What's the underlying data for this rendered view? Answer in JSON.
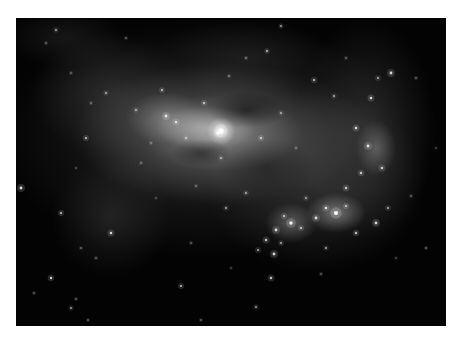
{
  "image": {
    "subject": "irregular dwarf galaxy",
    "palette": {
      "background": "#ffffff",
      "sky": "#030303",
      "core": "#ffffff",
      "glow": "#9a9a9a"
    },
    "frame": {
      "left": 16,
      "top": 18,
      "width": 430,
      "height": 308
    }
  },
  "stars": [
    [
      205,
      113,
      3.2,
      1.0
    ],
    [
      202,
      115,
      2.2,
      0.9
    ],
    [
      150,
      98,
      1.8,
      0.8
    ],
    [
      160,
      104,
      1.5,
      0.7
    ],
    [
      120,
      92,
      1.2,
      0.6
    ],
    [
      188,
      85,
      1.4,
      0.7
    ],
    [
      230,
      40,
      1.0,
      0.6
    ],
    [
      251,
      33,
      1.2,
      0.7
    ],
    [
      146,
      72,
      1.3,
      0.7
    ],
    [
      213,
      58,
      1.0,
      0.6
    ],
    [
      298,
      62,
      1.4,
      0.7
    ],
    [
      318,
      78,
      1.2,
      0.6
    ],
    [
      355,
      80,
      1.6,
      0.8
    ],
    [
      362,
      60,
      1.3,
      0.6
    ],
    [
      375,
      55,
      1.8,
      0.8
    ],
    [
      340,
      110,
      1.6,
      0.8
    ],
    [
      352,
      128,
      1.8,
      0.8
    ],
    [
      366,
      150,
      1.6,
      0.7
    ],
    [
      345,
      155,
      1.5,
      0.7
    ],
    [
      330,
      170,
      1.6,
      0.7
    ],
    [
      320,
      195,
      2.6,
      0.95
    ],
    [
      310,
      190,
      1.6,
      0.8
    ],
    [
      330,
      188,
      1.4,
      0.7
    ],
    [
      300,
      200,
      1.8,
      0.8
    ],
    [
      275,
      205,
      2.2,
      0.9
    ],
    [
      268,
      198,
      1.4,
      0.7
    ],
    [
      285,
      210,
      1.4,
      0.7
    ],
    [
      260,
      212,
      1.8,
      0.8
    ],
    [
      250,
      222,
      1.6,
      0.7
    ],
    [
      242,
      232,
      1.4,
      0.6
    ],
    [
      258,
      236,
      1.8,
      0.8
    ],
    [
      265,
      225,
      1.3,
      0.6
    ],
    [
      340,
      215,
      1.5,
      0.7
    ],
    [
      360,
      205,
      1.8,
      0.8
    ],
    [
      372,
      190,
      1.3,
      0.6
    ],
    [
      290,
      180,
      1.2,
      0.6
    ],
    [
      230,
      175,
      1.3,
      0.6
    ],
    [
      210,
      190,
      1.2,
      0.6
    ],
    [
      180,
      168,
      1.0,
      0.5
    ],
    [
      70,
      120,
      1.4,
      0.7
    ],
    [
      90,
      75,
      1.2,
      0.6
    ],
    [
      75,
      85,
      1.0,
      0.5
    ],
    [
      55,
      55,
      1.0,
      0.5
    ],
    [
      5,
      170,
      1.8,
      0.85
    ],
    [
      45,
      195,
      1.4,
      0.7
    ],
    [
      65,
      230,
      1.0,
      0.5
    ],
    [
      95,
      215,
      1.6,
      0.8
    ],
    [
      80,
      240,
      1.0,
      0.5
    ],
    [
      35,
      260,
      1.5,
      0.8
    ],
    [
      55,
      290,
      1.2,
      0.6
    ],
    [
      60,
      281,
      1.0,
      0.5
    ],
    [
      18,
      275,
      1.0,
      0.5
    ],
    [
      72,
      302,
      1.0,
      0.5
    ],
    [
      165,
      268,
      1.4,
      0.7
    ],
    [
      185,
      302,
      1.0,
      0.5
    ],
    [
      240,
      289,
      1.2,
      0.6
    ],
    [
      305,
      256,
      1.0,
      0.5
    ],
    [
      255,
      260,
      1.6,
      0.7
    ],
    [
      400,
      60,
      1.0,
      0.5
    ],
    [
      410,
      230,
      1.0,
      0.5
    ],
    [
      395,
      178,
      1.0,
      0.5
    ],
    [
      420,
      130,
      0.8,
      0.4
    ],
    [
      30,
      25,
      1.0,
      0.5
    ],
    [
      40,
      12,
      1.2,
      0.6
    ],
    [
      110,
      20,
      1.0,
      0.5
    ],
    [
      265,
      8,
      1.2,
      0.6
    ],
    [
      330,
      40,
      1.0,
      0.5
    ],
    [
      60,
      150,
      0.9,
      0.4
    ],
    [
      125,
      145,
      1.0,
      0.5
    ],
    [
      140,
      180,
      0.9,
      0.4
    ],
    [
      175,
      225,
      1.0,
      0.5
    ],
    [
      215,
      250,
      0.9,
      0.4
    ],
    [
      310,
      230,
      1.2,
      0.6
    ],
    [
      380,
      240,
      0.9,
      0.4
    ],
    [
      205,
      140,
      1.2,
      0.6
    ],
    [
      245,
      120,
      1.4,
      0.7
    ],
    [
      265,
      95,
      1.2,
      0.6
    ],
    [
      280,
      130,
      1.0,
      0.5
    ],
    [
      170,
      120,
      1.2,
      0.6
    ],
    [
      135,
      125,
      1.0,
      0.5
    ]
  ]
}
